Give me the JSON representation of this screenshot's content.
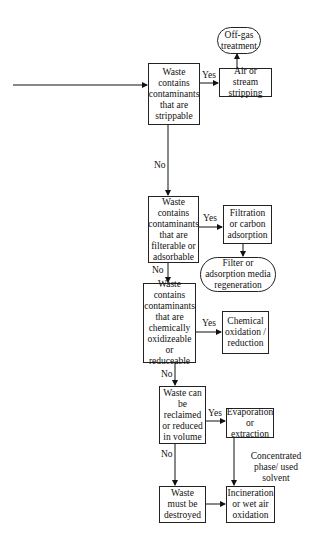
{
  "diagram": {
    "type": "flowchart",
    "decisions": [
      {
        "id": "strippable",
        "text": "Waste contains contaminants that are strippable"
      },
      {
        "id": "filterable",
        "text": "Waste contains contaminants that are filterable or adsorbable"
      },
      {
        "id": "oxidizeable",
        "text": "Waste contains contaminants that are chemically oxidizeable or reduceable"
      },
      {
        "id": "reclaimable",
        "text": "Waste can be reclaimed or reduced in volume"
      },
      {
        "id": "destroy",
        "text": "Waste must be destroyed"
      }
    ],
    "processes": [
      {
        "id": "stripping",
        "text": "Air or stream stripping"
      },
      {
        "id": "offgas",
        "text": "Off-gas treatment"
      },
      {
        "id": "filtration",
        "text": "Filtration or carbon adsorption"
      },
      {
        "id": "regeneration",
        "text": "Filter or adsorption media regeneration"
      },
      {
        "id": "chemical",
        "text": "Chemical oxidation / reduction"
      },
      {
        "id": "evaporation",
        "text": "Evaporation or extraction"
      },
      {
        "id": "incineration",
        "text": "Incineration or wet air oxidation"
      }
    ],
    "edge_labels": {
      "yes": "Yes",
      "no": "No",
      "concentrated": "Concentrated phase/ used solvent"
    }
  }
}
